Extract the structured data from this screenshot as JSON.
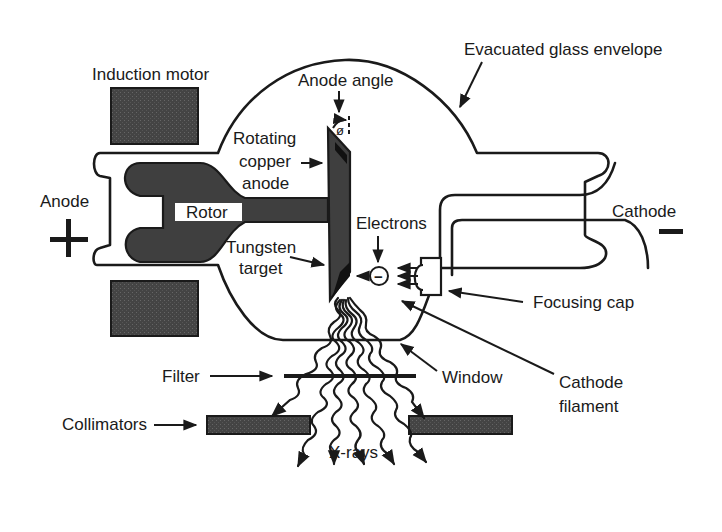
{
  "labels": {
    "induction_motor": "Induction motor",
    "anode_angle": "Anode angle",
    "evacuated_glass_envelope": "Evacuated glass envelope",
    "rotating_copper_anode": [
      "Rotating",
      "copper",
      "anode"
    ],
    "anode": "Anode",
    "anode_sign": "+",
    "rotor": "Rotor",
    "tungsten_target": [
      "Tungsten",
      "target"
    ],
    "electrons": "Electrons",
    "electron_sign": "−",
    "cathode": "Cathode",
    "cathode_sign": "−",
    "focusing_cap": "Focusing cap",
    "cathode_filament": [
      "Cathode",
      "filament"
    ],
    "filter": "Filter",
    "window": "Window",
    "collimators": "Collimators",
    "x_rays": "X-rays",
    "angle_symbol": "ø"
  },
  "colors": {
    "ink": "#1a1a1a",
    "fill_dark": "#3f3f3f",
    "background": "#ffffff"
  }
}
